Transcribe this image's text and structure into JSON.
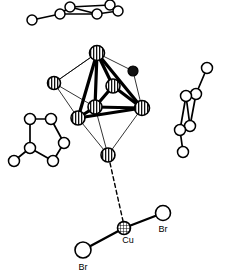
{
  "figure": {
    "type": "crystal-structure-diagram",
    "background_color": "#ffffff",
    "line_color": "#000000",
    "width": 226,
    "height": 278
  },
  "labels": {
    "cu": "Cu",
    "br_right": "Br",
    "br_bottom": "Br"
  },
  "cluster": {
    "name": "octahedral-metal-cluster",
    "vertex_style": "striped-sphere",
    "vertices": [
      {
        "id": "apex-top",
        "x": 97,
        "y": 53,
        "r": 7.5,
        "style": "striped"
      },
      {
        "id": "left-outer",
        "x": 54,
        "y": 83,
        "r": 6.5,
        "style": "striped"
      },
      {
        "id": "inner-upper",
        "x": 113,
        "y": 86,
        "r": 7.0,
        "style": "striped"
      },
      {
        "id": "inner-lower",
        "x": 95,
        "y": 107,
        "r": 7.0,
        "style": "striped"
      },
      {
        "id": "left-lower",
        "x": 78,
        "y": 118,
        "r": 7.0,
        "style": "striped"
      },
      {
        "id": "right-lower",
        "x": 142,
        "y": 108,
        "r": 7.5,
        "style": "striped"
      },
      {
        "id": "apex-bottom",
        "x": 108,
        "y": 155,
        "r": 7.0,
        "style": "striped"
      },
      {
        "id": "black-atom",
        "x": 133,
        "y": 71,
        "r": 5.0,
        "style": "filled"
      }
    ],
    "bold_bonds": [
      [
        "apex-top",
        "inner-lower"
      ],
      [
        "apex-top",
        "left-lower"
      ],
      [
        "apex-top",
        "right-lower"
      ],
      [
        "apex-top",
        "inner-upper"
      ],
      [
        "inner-upper",
        "right-lower"
      ],
      [
        "inner-lower",
        "left-lower"
      ],
      [
        "inner-lower",
        "right-lower"
      ],
      [
        "left-lower",
        "right-lower"
      ],
      [
        "inner-upper",
        "inner-lower"
      ]
    ],
    "thin_bonds": [
      [
        "apex-top",
        "left-outer"
      ],
      [
        "left-outer",
        "left-lower"
      ],
      [
        "left-outer",
        "inner-lower"
      ],
      [
        "apex-top",
        "black-atom"
      ],
      [
        "black-atom",
        "right-lower"
      ],
      [
        "left-lower",
        "apex-bottom"
      ],
      [
        "right-lower",
        "apex-bottom"
      ],
      [
        "inner-lower",
        "apex-bottom"
      ],
      [
        "left-outer",
        "apex-top"
      ]
    ]
  },
  "copper_unit": {
    "name": "copper-dibromide-unit",
    "copper": {
      "x": 124,
      "y": 228,
      "r": 6.5,
      "style": "cross-hatched"
    },
    "bromines": [
      {
        "id": "br-right",
        "x": 163,
        "y": 213,
        "r": 7.5,
        "label": "Br",
        "label_x": 163,
        "label_y": 232
      },
      {
        "id": "br-bottom",
        "x": 83,
        "y": 250,
        "r": 8.0,
        "label": "Br",
        "label_x": 83,
        "label_y": 270
      }
    ],
    "dashed_bond": {
      "from": [
        110,
        163
      ],
      "to": [
        123,
        221
      ]
    },
    "cu_label_pos": {
      "x": 128,
      "y": 243
    }
  },
  "fragments": [
    {
      "name": "top-ring-fragment",
      "style": "open-circle",
      "atoms": [
        {
          "x": 32,
          "y": 20,
          "r": 5.0
        },
        {
          "x": 60,
          "y": 14,
          "r": 5.0
        },
        {
          "x": 70,
          "y": 7,
          "r": 5.0
        },
        {
          "x": 97,
          "y": 14,
          "r": 5.0
        },
        {
          "x": 110,
          "y": 5,
          "r": 5.0
        },
        {
          "x": 118,
          "y": 11,
          "r": 5.0
        }
      ],
      "bonds": [
        [
          0,
          1
        ],
        [
          1,
          2
        ],
        [
          2,
          4
        ],
        [
          1,
          3
        ],
        [
          3,
          5
        ],
        [
          4,
          5
        ],
        [
          2,
          3
        ]
      ]
    },
    {
      "name": "left-ring-fragment",
      "style": "open-circle",
      "atoms": [
        {
          "x": 30,
          "y": 119,
          "r": 5.5
        },
        {
          "x": 51,
          "y": 119,
          "r": 5.5
        },
        {
          "x": 64,
          "y": 143,
          "r": 5.5
        },
        {
          "x": 53,
          "y": 161,
          "r": 5.5
        },
        {
          "x": 30,
          "y": 148,
          "r": 5.5
        },
        {
          "x": 14,
          "y": 161,
          "r": 5.5
        }
      ],
      "bonds": [
        [
          0,
          1
        ],
        [
          1,
          2
        ],
        [
          2,
          3
        ],
        [
          3,
          4
        ],
        [
          4,
          0
        ],
        [
          4,
          5
        ]
      ]
    },
    {
      "name": "right-ring-fragment",
      "style": "open-circle",
      "atoms": [
        {
          "x": 207,
          "y": 68,
          "r": 5.5
        },
        {
          "x": 196,
          "y": 94,
          "r": 5.5
        },
        {
          "x": 186,
          "y": 96,
          "r": 5.5
        },
        {
          "x": 190,
          "y": 126,
          "r": 5.5
        },
        {
          "x": 180,
          "y": 130,
          "r": 5.5
        },
        {
          "x": 183,
          "y": 152,
          "r": 5.5
        }
      ],
      "bonds": [
        [
          0,
          1
        ],
        [
          1,
          2
        ],
        [
          1,
          3
        ],
        [
          2,
          4
        ],
        [
          3,
          4
        ],
        [
          4,
          5
        ],
        [
          2,
          3
        ]
      ]
    }
  ]
}
